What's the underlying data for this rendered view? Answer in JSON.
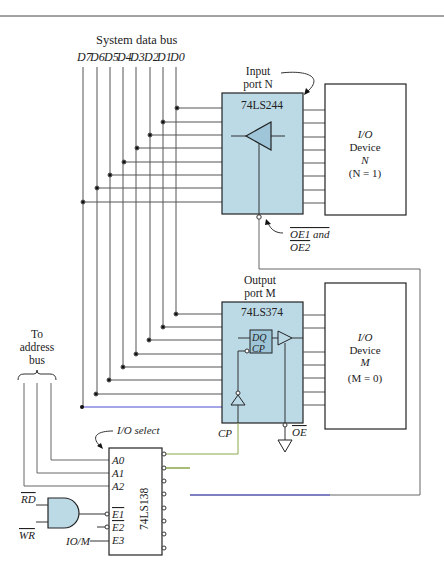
{
  "title": "System data bus",
  "data_bits": [
    "D7",
    "D6",
    "D5",
    "D4",
    "D3",
    "D2",
    "D1",
    "D0"
  ],
  "input_port": {
    "label_line1": "Input",
    "label_line2": "port N",
    "chip": "74LS244",
    "device_line1": "I/O",
    "device_line2": "Device",
    "device_line3": "N",
    "device_line4": "(N = 1)",
    "enable_label_1": "OE1 and",
    "enable_label_2": "OE2"
  },
  "output_port": {
    "label_line1": "Output",
    "label_line2": "port M",
    "chip": "74LS374",
    "ff_dq": "DQ",
    "ff_cp": "CP",
    "device_line1": "I/O",
    "device_line2": "Device",
    "device_line3": "M",
    "device_line4": "(M = 0)",
    "cp_label": "CP",
    "oe_label": "OE"
  },
  "address_bus": {
    "line1": "To",
    "line2": "address",
    "line3": "bus"
  },
  "decoder": {
    "chip": "74LS138",
    "select_label": "I/O select",
    "inputs": [
      "A0",
      "A1",
      "A2"
    ],
    "enables": [
      "E1",
      "E2",
      "E3"
    ],
    "io_m_label": "IO/M",
    "rd_label": "RD",
    "wr_label": "WR"
  },
  "colors": {
    "chip_fill": "#bcd9e6",
    "line": "#555555",
    "blue_wire": "#4a4ad0",
    "green_wire": "#8aa84a"
  }
}
